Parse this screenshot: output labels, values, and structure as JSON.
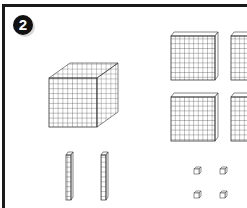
{
  "problem": {
    "number_badge": "2"
  },
  "base_ten_blocks": {
    "thousands_cubes": 1,
    "hundreds_flats": 4,
    "tens_rods": 2,
    "ones_units": 4
  },
  "colors": {
    "line": "#333333",
    "border": "#1a1a1a",
    "background": "#ffffff"
  }
}
